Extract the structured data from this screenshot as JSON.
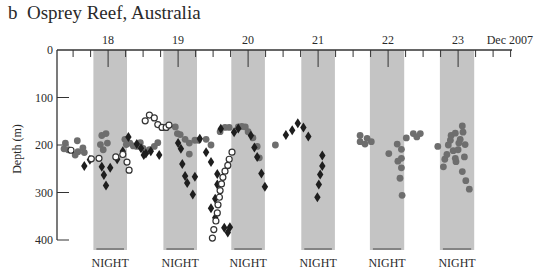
{
  "figure": {
    "panel_label": "b",
    "title": "Osprey Reef, Australia",
    "title_full": "b  Osprey Reef, Australia"
  },
  "colors": {
    "night_band": "#c4c4c4",
    "axis": "#333333",
    "filled_circle": "#6e6e6e",
    "diamond": "#1e1e1e",
    "open_circle_stroke": "#333333"
  },
  "chart_data": {
    "type": "scatter",
    "title": "Osprey Reef, Australia",
    "panel": "b",
    "xlabel": "Dec 2007",
    "ylabel": "Depth (m)",
    "ylim": [
      0,
      400
    ],
    "y_inverted": true,
    "yticks": [
      0,
      100,
      200,
      300,
      400
    ],
    "xticks": [
      {
        "day": 18,
        "label": "18"
      },
      {
        "day": 19,
        "label": "19"
      },
      {
        "day": 20,
        "label": "20"
      },
      {
        "day": 21,
        "label": "21"
      },
      {
        "day": 22,
        "label": "22"
      },
      {
        "day": 23,
        "label": "23"
      }
    ],
    "x_month_label": "Dec 2007",
    "xlim_days": [
      17.27,
      23.77
    ],
    "night_periods": [
      {
        "start": 17.79,
        "end": 18.27,
        "label": "NIGHT"
      },
      {
        "start": 18.79,
        "end": 19.27,
        "label": "NIGHT"
      },
      {
        "start": 19.76,
        "end": 20.24,
        "label": "NIGHT"
      },
      {
        "start": 20.76,
        "end": 21.24,
        "label": "NIGHT"
      },
      {
        "start": 21.74,
        "end": 22.23,
        "label": "NIGHT"
      },
      {
        "start": 22.74,
        "end": 23.23,
        "label": "NIGHT"
      }
    ],
    "legend": [],
    "series": [
      {
        "name": "Shark A (filled grey circles)",
        "marker": "filled-circle",
        "points": [
          [
            17.39,
            196
          ],
          [
            17.37,
            208
          ],
          [
            17.43,
            210
          ],
          [
            17.56,
            191
          ],
          [
            17.57,
            214
          ],
          [
            17.53,
            221
          ],
          [
            17.64,
            206
          ],
          [
            17.66,
            216
          ],
          [
            17.89,
            199
          ],
          [
            17.91,
            180
          ],
          [
            17.93,
            210
          ],
          [
            17.97,
            176
          ],
          [
            17.99,
            196
          ],
          [
            18.24,
            188
          ],
          [
            18.26,
            199
          ],
          [
            18.31,
            196
          ],
          [
            18.36,
            202
          ],
          [
            18.41,
            203
          ],
          [
            18.46,
            195
          ],
          [
            18.5,
            207
          ],
          [
            18.54,
            215
          ],
          [
            18.59,
            210
          ],
          [
            18.66,
            203
          ],
          [
            18.71,
            195
          ],
          [
            18.96,
            162
          ],
          [
            18.99,
            176
          ],
          [
            19.03,
            178
          ],
          [
            19.1,
            188
          ],
          [
            19.16,
            196
          ],
          [
            19.24,
            190
          ],
          [
            19.29,
            190
          ],
          [
            19.4,
            188
          ],
          [
            19.47,
            200
          ],
          [
            19.16,
            219
          ],
          [
            19.6,
            172
          ],
          [
            19.67,
            163
          ],
          [
            19.73,
            163
          ],
          [
            19.86,
            162
          ],
          [
            19.91,
            161
          ],
          [
            19.96,
            162
          ],
          [
            20.0,
            172
          ],
          [
            20.07,
            185
          ],
          [
            20.13,
            203
          ],
          [
            20.16,
            227
          ],
          [
            20.39,
            200
          ],
          [
            21.6,
            180
          ],
          [
            21.6,
            193
          ],
          [
            21.67,
            198
          ],
          [
            21.7,
            186
          ],
          [
            21.76,
            193
          ],
          [
            22.01,
            218
          ],
          [
            22.13,
            198
          ],
          [
            22.19,
            228
          ],
          [
            22.19,
            248
          ],
          [
            22.17,
            270
          ],
          [
            22.2,
            306
          ],
          [
            22.14,
            234
          ],
          [
            22.19,
            209
          ],
          [
            22.26,
            185
          ],
          [
            22.36,
            176
          ],
          [
            22.41,
            183
          ],
          [
            22.46,
            176
          ],
          [
            22.71,
            203
          ],
          [
            22.79,
            246
          ],
          [
            22.81,
            230
          ],
          [
            22.84,
            220
          ],
          [
            22.86,
            200
          ],
          [
            22.89,
            190
          ],
          [
            22.9,
            180
          ],
          [
            22.93,
            212
          ],
          [
            22.97,
            235
          ],
          [
            23.0,
            210
          ],
          [
            23.03,
            188
          ],
          [
            23.01,
            196
          ],
          [
            23.06,
            160
          ],
          [
            23.07,
            173
          ],
          [
            23.1,
            199
          ],
          [
            23.09,
            225
          ],
          [
            23.06,
            256
          ],
          [
            23.11,
            275
          ],
          [
            23.16,
            293
          ],
          [
            22.96,
            175
          ],
          [
            22.96,
            228
          ]
        ]
      },
      {
        "name": "Shark B (black diamonds)",
        "marker": "diamond",
        "points": [
          [
            17.66,
            244
          ],
          [
            17.74,
            231
          ],
          [
            17.91,
            246
          ],
          [
            17.94,
            263
          ],
          [
            17.97,
            285
          ],
          [
            18.03,
            248
          ],
          [
            18.13,
            230
          ],
          [
            18.21,
            213
          ],
          [
            18.29,
            183
          ],
          [
            18.41,
            198
          ],
          [
            18.47,
            207
          ],
          [
            18.51,
            221
          ],
          [
            18.54,
            218
          ],
          [
            18.61,
            213
          ],
          [
            18.73,
            221
          ],
          [
            19.0,
            196
          ],
          [
            19.04,
            208
          ],
          [
            19.06,
            240
          ],
          [
            19.1,
            265
          ],
          [
            19.13,
            280
          ],
          [
            19.21,
            304
          ],
          [
            19.24,
            267
          ],
          [
            19.31,
            187
          ],
          [
            19.4,
            215
          ],
          [
            19.47,
            236
          ],
          [
            19.56,
            261
          ],
          [
            19.56,
            283
          ],
          [
            19.53,
            313
          ],
          [
            19.47,
            333
          ],
          [
            19.53,
            353
          ],
          [
            19.66,
            374
          ],
          [
            19.71,
            384
          ],
          [
            19.74,
            373
          ],
          [
            19.61,
            166
          ],
          [
            19.8,
            173
          ],
          [
            19.86,
            165
          ],
          [
            20.04,
            180
          ],
          [
            20.09,
            205
          ],
          [
            20.13,
            225
          ],
          [
            20.19,
            260
          ],
          [
            20.24,
            288
          ],
          [
            20.54,
            179
          ],
          [
            20.63,
            169
          ],
          [
            20.71,
            154
          ],
          [
            20.79,
            163
          ],
          [
            20.86,
            182
          ],
          [
            21.06,
            222
          ],
          [
            21.06,
            244
          ],
          [
            21.03,
            262
          ],
          [
            21.01,
            283
          ],
          [
            20.99,
            310
          ]
        ]
      },
      {
        "name": "Shark C (open circles)",
        "marker": "open-circle",
        "points": [
          [
            17.47,
            211
          ],
          [
            17.76,
            229
          ],
          [
            17.87,
            228
          ],
          [
            18.11,
            225
          ],
          [
            18.21,
            220
          ],
          [
            18.27,
            236
          ],
          [
            18.3,
            253
          ],
          [
            18.53,
            149
          ],
          [
            18.59,
            137
          ],
          [
            18.66,
            143
          ],
          [
            18.71,
            157
          ],
          [
            18.77,
            163
          ],
          [
            18.83,
            163
          ],
          [
            18.87,
            158
          ],
          [
            19.77,
            215
          ],
          [
            19.73,
            230
          ],
          [
            19.71,
            243
          ],
          [
            19.67,
            255
          ],
          [
            19.64,
            268
          ],
          [
            19.62,
            282
          ],
          [
            19.6,
            296
          ],
          [
            19.59,
            310
          ],
          [
            19.57,
            326
          ],
          [
            19.56,
            343
          ],
          [
            19.54,
            360
          ],
          [
            19.51,
            378
          ],
          [
            19.49,
            396
          ]
        ]
      }
    ]
  }
}
